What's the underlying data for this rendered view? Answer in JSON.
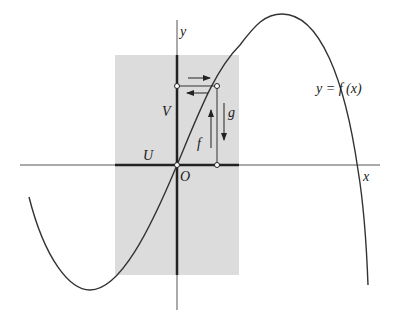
{
  "diagram": {
    "labels": {
      "y_axis": "y",
      "x_axis": "x",
      "origin": "O",
      "region_U": "U",
      "region_V": "V",
      "map_f": "f",
      "map_g": "g",
      "curve": "y = f (x)"
    },
    "colors": {
      "shade": "#dcdcdc",
      "ink": "#222222",
      "axis": "#555555"
    }
  }
}
